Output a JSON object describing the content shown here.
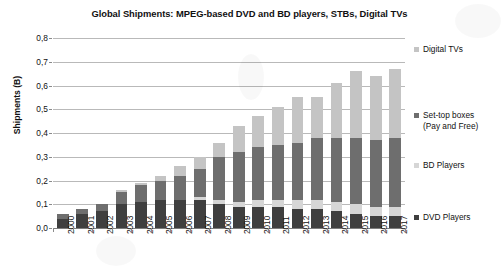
{
  "chart_data": {
    "type": "bar",
    "subtype": "stacked-column",
    "title": "Global Shipments: MPEG-based DVD and BD players, STBs, Digital TVs",
    "xlabel": "",
    "ylabel": "Shipments (B)",
    "ylim": [
      0,
      0.8
    ],
    "ytick_step": 0.1,
    "grid": true,
    "legend_position": "right",
    "decimal_separator": ",",
    "categories": [
      "2000",
      "2001",
      "2002",
      "2003",
      "2004",
      "2005",
      "2006",
      "2007",
      "2008",
      "2009",
      "2010",
      "2011",
      "2012",
      "2013",
      "2014",
      "2015",
      "2016",
      "2017"
    ],
    "ytick_labels": [
      "0,0",
      "0,1",
      "0,2",
      "0,3",
      "0,4",
      "0,5",
      "0,6",
      "0,7",
      "0,8"
    ],
    "ytick_values": [
      0.0,
      0.1,
      0.2,
      0.3,
      0.4,
      0.5,
      0.6,
      0.7,
      0.8
    ],
    "series": [
      {
        "name": "DVD Players",
        "color": "#3f3f3f",
        "values": [
          0.04,
          0.06,
          0.07,
          0.1,
          0.11,
          0.12,
          0.12,
          0.12,
          0.1,
          0.09,
          0.09,
          0.09,
          0.08,
          0.08,
          0.07,
          0.06,
          0.05,
          0.05
        ]
      },
      {
        "name": "BD Players",
        "color": "#d6d6d6",
        "values": [
          0.0,
          0.0,
          0.0,
          0.0,
          0.0,
          0.0,
          0.0,
          0.01,
          0.02,
          0.02,
          0.03,
          0.03,
          0.04,
          0.04,
          0.04,
          0.04,
          0.04,
          0.04
        ]
      },
      {
        "name": "Set-top boxes (Pay and Free)",
        "color": "#6e6e6e",
        "values": [
          0.02,
          0.02,
          0.03,
          0.05,
          0.07,
          0.08,
          0.1,
          0.12,
          0.18,
          0.21,
          0.22,
          0.23,
          0.24,
          0.26,
          0.27,
          0.28,
          0.28,
          0.29
        ]
      },
      {
        "name": "Digital TVs",
        "color": "#c4c4c4",
        "values": [
          0.0,
          0.0,
          0.0,
          0.01,
          0.01,
          0.02,
          0.04,
          0.05,
          0.06,
          0.11,
          0.13,
          0.16,
          0.19,
          0.17,
          0.23,
          0.28,
          0.27,
          0.29
        ]
      }
    ],
    "totals": [
      0.06,
      0.08,
      0.1,
      0.16,
      0.19,
      0.22,
      0.26,
      0.3,
      0.36,
      0.43,
      0.47,
      0.51,
      0.55,
      0.55,
      0.61,
      0.66,
      0.64,
      0.67
    ],
    "legend_entries": [
      {
        "label": "Digital TVs",
        "color": "#c4c4c4"
      },
      {
        "label": "Set-top boxes",
        "label2": "(Pay and Free)",
        "color": "#6e6e6e"
      },
      {
        "label": "BD Players",
        "color": "#d6d6d6"
      },
      {
        "label": "DVD Players",
        "color": "#3f3f3f"
      }
    ]
  }
}
